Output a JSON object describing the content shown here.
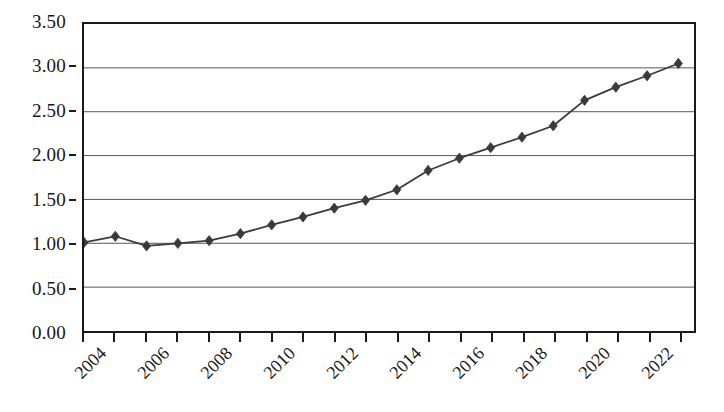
{
  "chart_data": {
    "type": "line",
    "title": "",
    "subtitle": "",
    "xlabel": "",
    "ylabel": "",
    "grid": true,
    "legend": false,
    "legend_position": "none",
    "marker": "diamond",
    "series_color": "#3a3a3a",
    "line_color": "#3a3a3a",
    "axis_color": "#1a1a1a",
    "grid_color": "#555555",
    "background": "#ffffff",
    "xlim": [
      2004,
      2023.5
    ],
    "ylim": [
      0.0,
      3.5
    ],
    "y_ticks": [
      0.0,
      0.5,
      1.0,
      1.5,
      2.0,
      2.5,
      3.0,
      3.5
    ],
    "y_tick_labels": [
      "0.00",
      "0.50",
      "1.00",
      "1.50",
      "2.00",
      "2.50",
      "3.00",
      "3.50"
    ],
    "x_ticks": [
      2004,
      2005,
      2006,
      2007,
      2008,
      2009,
      2010,
      2011,
      2012,
      2013,
      2014,
      2015,
      2016,
      2017,
      2018,
      2019,
      2020,
      2021,
      2022,
      2023
    ],
    "x_tick_labels": [
      "2004",
      "",
      "2006",
      "",
      "2008",
      "",
      "2010",
      "",
      "2012",
      "",
      "2014",
      "",
      "2016",
      "",
      "2018",
      "",
      "2020",
      "",
      "2022",
      ""
    ],
    "x_visible_labels": [
      "2004",
      "2006",
      "2008",
      "2010",
      "2012",
      "2014",
      "2016",
      "2018",
      "2020",
      "2022"
    ],
    "x": [
      2004,
      2005,
      2006,
      2007,
      2008,
      2009,
      2010,
      2011,
      2012,
      2013,
      2014,
      2015,
      2016,
      2017,
      2018,
      2019,
      2020,
      2021,
      2022,
      2023
    ],
    "values": [
      1.01,
      1.08,
      0.97,
      1.0,
      1.03,
      1.11,
      1.21,
      1.3,
      1.4,
      1.49,
      1.61,
      1.83,
      1.97,
      2.09,
      2.21,
      2.34,
      2.63,
      2.78,
      2.91,
      3.05
    ]
  }
}
